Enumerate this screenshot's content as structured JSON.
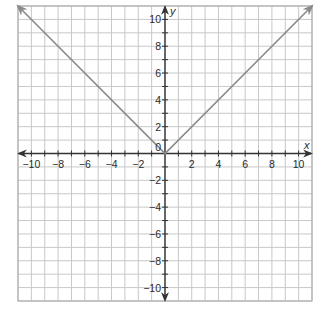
{
  "chart_data": {
    "type": "line",
    "title": "",
    "xlabel": "x",
    "ylabel": "y",
    "xlim": [
      -11,
      11
    ],
    "ylim": [
      -11,
      11
    ],
    "grid": true,
    "grid_step": 1,
    "x_ticks": [
      -10,
      -8,
      -6,
      -4,
      -2,
      2,
      4,
      6,
      8,
      10
    ],
    "y_ticks": [
      -10,
      -8,
      -6,
      -4,
      -2,
      2,
      4,
      6,
      8,
      10
    ],
    "x_tick_labels": [
      "−10",
      "−8",
      "−6",
      "−4",
      "−2",
      "2",
      "4",
      "6",
      "8",
      "10"
    ],
    "y_tick_labels": [
      "−10",
      "−8",
      "−6",
      "−4",
      "−2",
      "2",
      "4",
      "6",
      "8",
      "10"
    ],
    "origin_label": "0",
    "series": [
      {
        "name": "y = |x|",
        "points": [
          [
            -11,
            11
          ],
          [
            0,
            0
          ],
          [
            11,
            11
          ]
        ],
        "arrows_at_ends": true,
        "color": "#8a8a8a"
      }
    ],
    "colors": {
      "grid": "#c8c8c8",
      "axis": "#333333",
      "curve": "#8a8a8a",
      "frame": "#b0b0b0"
    }
  }
}
